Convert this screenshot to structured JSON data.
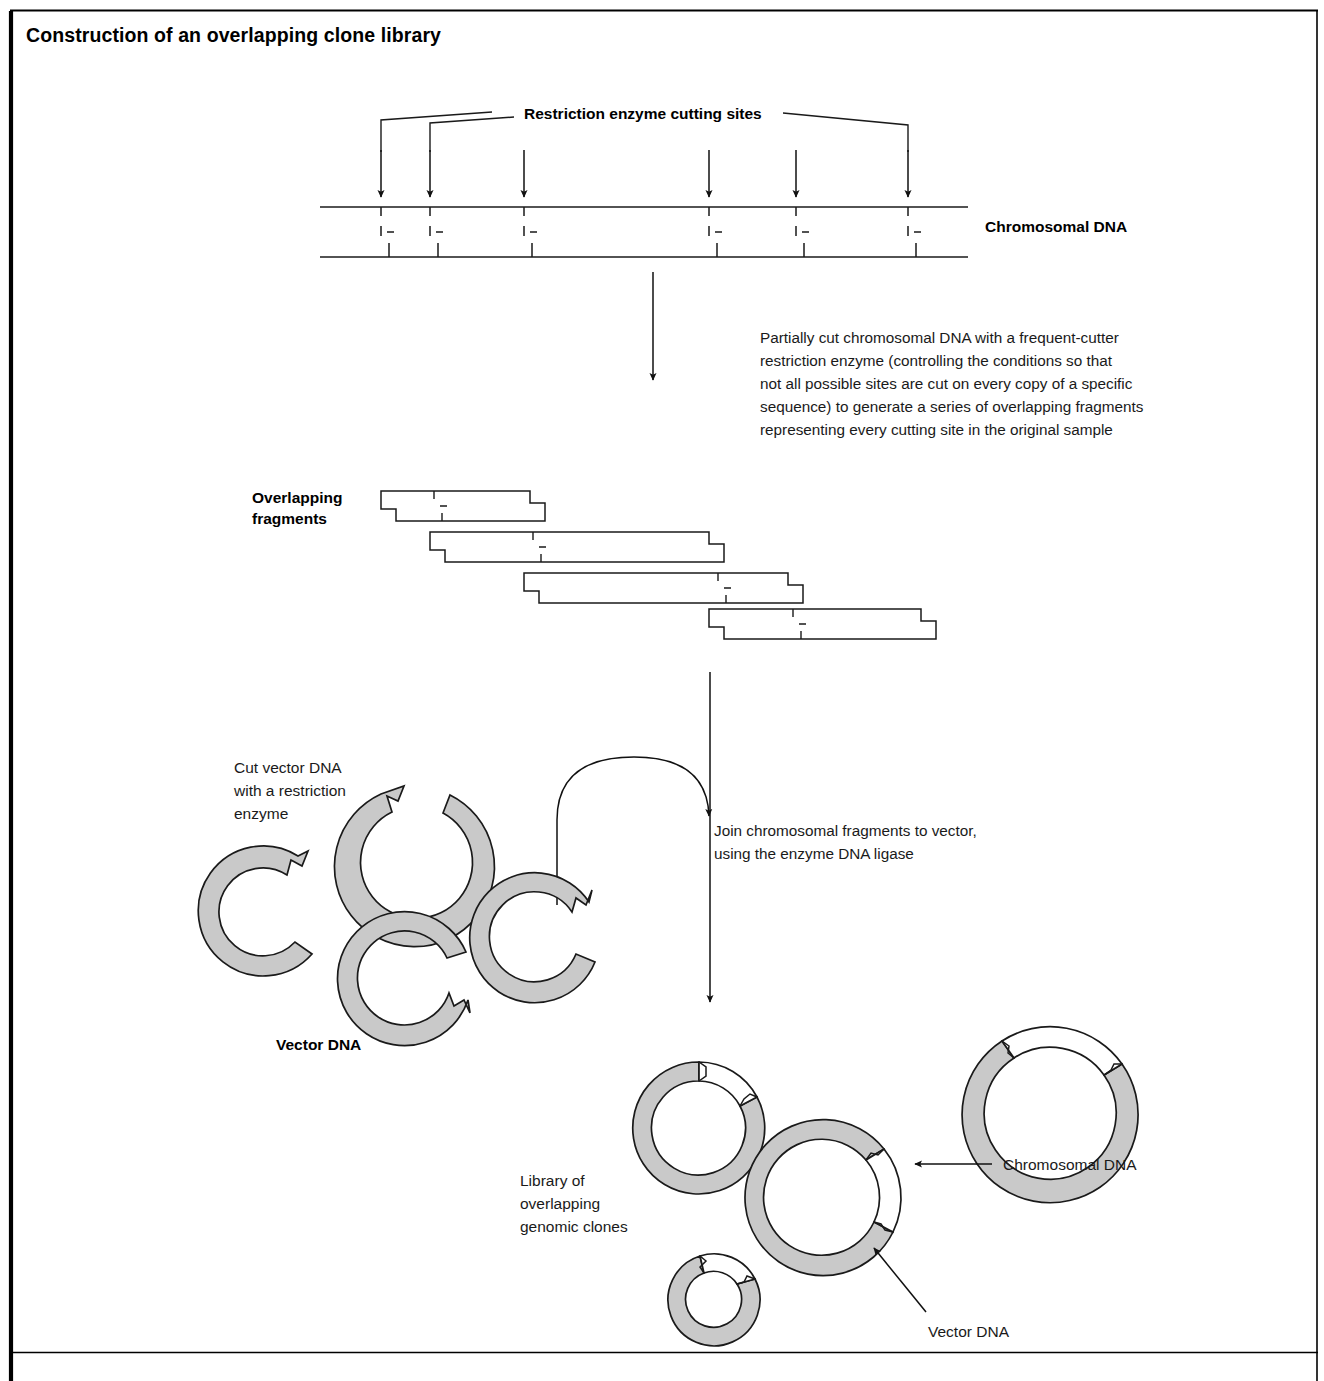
{
  "figure": {
    "title": "Construction of an overlapping clone library",
    "domain_type": "biology-process-diagram"
  },
  "labels": {
    "restriction_sites": "Restriction enzyme cutting sites",
    "chromosomal_dna_top": "Chromosomal DNA",
    "overlapping_fragments_line1": "Overlapping",
    "overlapping_fragments_line2": "fragments",
    "cut_vector_line1": "Cut vector DNA",
    "cut_vector_line2": "with a restriction",
    "cut_vector_line3": "enzyme",
    "vector_dna_mid": "Vector DNA",
    "library_line1": "Library of",
    "library_line2": "overlapping",
    "library_line3": "genomic clones",
    "chromosomal_dna_callout": "Chromosomal DNA",
    "vector_dna_callout": "Vector DNA"
  },
  "steps": {
    "step1_line1": "Partially cut chromosomal DNA with a frequent-cutter",
    "step1_line2": "restriction enzyme (controlling the conditions so that",
    "step1_line3": "not all possible sites are cut on every copy of a specific",
    "step1_line4": "sequence) to generate a series of overlapping fragments",
    "step1_line5": "representing every cutting site in the original sample",
    "step2_line1": "Join chromosomal fragments to vector,",
    "step2_line2": "using the enzyme DNA ligase"
  },
  "colors": {
    "vector_fill": "#c9c9c9",
    "insert_fill": "#ffffff",
    "ink": "#1a1a1a",
    "page": "#ffffff"
  },
  "diagram_data": {
    "type": "process-diagram",
    "chromosomal_dna": {
      "x_start": 320,
      "x_end": 968,
      "top_strand_y": 207,
      "bottom_strand_y": 257,
      "cut_site_x": [
        381,
        430,
        524,
        709,
        796,
        908
      ],
      "cut_site_count": 6
    },
    "cut_arrows_x": [
      381,
      430,
      524,
      709,
      796,
      908
    ],
    "overlapping_fragments": [
      {
        "index": 1,
        "left": 381,
        "right": 545,
        "top": 491,
        "bottom": 521,
        "internal_cut_x": 434
      },
      {
        "index": 2,
        "left": 430,
        "right": 724,
        "top": 532,
        "bottom": 562,
        "internal_cut_x": 533
      },
      {
        "index": 3,
        "left": 524,
        "right": 803,
        "top": 573,
        "bottom": 603,
        "internal_cut_x": 718
      },
      {
        "index": 4,
        "left": 709,
        "right": 936,
        "top": 609,
        "bottom": 639,
        "internal_cut_x": 793
      }
    ],
    "cut_vectors": [
      {
        "id": "v1",
        "cx": 265,
        "cy": 913,
        "r_outer": 65,
        "r_inner": 44,
        "gap_angle_deg": 70
      },
      {
        "id": "v2",
        "cx": 414,
        "cy": 866,
        "r_outer": 80,
        "r_inner": 56,
        "gap_angle_deg": 84
      },
      {
        "id": "v3",
        "cx": 405,
        "cy": 978,
        "r_outer": 67,
        "r_inner": 47,
        "gap_angle_deg": 10
      },
      {
        "id": "v4",
        "cx": 540,
        "cy": 935,
        "r_outer": 65,
        "r_inner": 45,
        "gap_angle_deg": 35
      }
    ],
    "recombinant_clones": [
      {
        "id": "c1",
        "cx": 698,
        "cy": 1128,
        "r_outer": 66,
        "r_inner": 47,
        "insert_arc_deg": 60
      },
      {
        "id": "c2",
        "cx": 831,
        "cy": 1188,
        "r_outer": 78,
        "r_inner": 58,
        "insert_arc_deg": 130
      },
      {
        "id": "c3",
        "cx": 1055,
        "cy": 1107,
        "r_outer": 88,
        "r_inner": 66,
        "insert_arc_deg": 85
      },
      {
        "id": "c4",
        "cx": 722,
        "cy": 1296,
        "r_outer": 46,
        "r_inner": 28,
        "insert_arc_deg": 80
      }
    ],
    "flow_arrows": [
      {
        "from": "chromosomal-dna",
        "to": "overlapping-fragments",
        "x": 653,
        "y1": 272,
        "y2": 385
      },
      {
        "from": "fragments-and-vectors",
        "to": "library",
        "x": 710,
        "y1": 672,
        "y2": 1008
      },
      {
        "from": "vectors",
        "to": "ligation-point",
        "type": "curved",
        "x": 560,
        "y": 757
      }
    ],
    "callout_arrows": [
      {
        "label": "Chromosomal DNA",
        "direction": "left",
        "tip_x": 911,
        "tip_y": 1164
      },
      {
        "label": "Vector DNA",
        "direction": "up-left",
        "tip_x": 872,
        "tip_y": 1245
      }
    ]
  }
}
